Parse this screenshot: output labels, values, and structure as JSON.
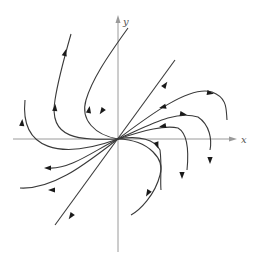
{
  "diagram": {
    "type": "phase-portrait",
    "axes": {
      "x_label": "x",
      "y_label": "y",
      "origin_px": [
        118,
        139
      ]
    },
    "colors": {
      "axis": "#9a9a9a",
      "trajectory": "#3a3a3a",
      "arrow": "#1a1a1a"
    },
    "trajectories": [
      {
        "name": "eigen-line",
        "path": "M 55 225 L 175 60"
      },
      {
        "name": "upper-left-outer",
        "path": "M 118 139 C 60 160, 20 150, 25 100"
      },
      {
        "name": "upper-left-mid",
        "path": "M 118 139 C 80 140, 48 140, 55 100 C 58 80, 65 55, 71 34"
      },
      {
        "name": "upper-left-inner",
        "path": "M 118 139 C 95 135, 80 120, 86 100 C 92 80, 105 60, 128 28"
      },
      {
        "name": "lower-left-1",
        "path": "M 118 139 C 95 150, 70 170, 48 168"
      },
      {
        "name": "lower-left-2",
        "path": "M 118 139 C 90 160, 55 190, 20 188"
      },
      {
        "name": "upper-right-1",
        "path": "M 118 139 C 150 115, 190 85, 212 92 C 228 98, 226 110, 227 120"
      },
      {
        "name": "upper-right-2",
        "path": "M 118 139 C 150 125, 175 110, 198 117 C 210 125, 212 140, 210 150"
      },
      {
        "name": "upper-right-3",
        "path": "M 118 139 C 145 130, 165 125, 178 128 C 190 135, 188 160, 187 170"
      },
      {
        "name": "lower-right-1",
        "path": "M 118 139 C 140 135, 155 140, 160 150 C 162 165, 160 180, 161 190"
      },
      {
        "name": "lower-right-2",
        "path": "M 118 139 C 150 140, 165 160, 160 175 C 155 195, 140 210, 131 215"
      }
    ],
    "arrows": [
      {
        "x": 165,
        "y": 85,
        "angle": -55
      },
      {
        "x": 102,
        "y": 111,
        "angle": 125
      },
      {
        "x": 71,
        "y": 216,
        "angle": 125
      },
      {
        "x": 89,
        "y": 110,
        "angle": -80
      },
      {
        "x": 65,
        "y": 53,
        "angle": -75
      },
      {
        "x": 22,
        "y": 123,
        "angle": -85
      },
      {
        "x": 55,
        "y": 108,
        "angle": -85
      },
      {
        "x": 48,
        "y": 168,
        "angle": 180
      },
      {
        "x": 52,
        "y": 190,
        "angle": 180
      },
      {
        "x": 210,
        "y": 93,
        "angle": 10
      },
      {
        "x": 163,
        "y": 107,
        "angle": 165
      },
      {
        "x": 183,
        "y": 114,
        "angle": 10
      },
      {
        "x": 163,
        "y": 126,
        "angle": 170
      },
      {
        "x": 210,
        "y": 160,
        "angle": 90
      },
      {
        "x": 182,
        "y": 175,
        "angle": 90
      },
      {
        "x": 157,
        "y": 145,
        "angle": 70
      },
      {
        "x": 148,
        "y": 193,
        "angle": 120
      }
    ]
  }
}
